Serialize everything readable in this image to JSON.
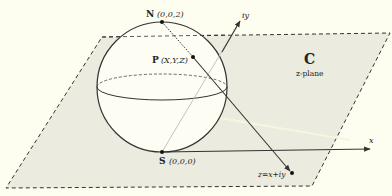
{
  "diagram": {
    "type": "stereographic-projection",
    "colors": {
      "background": "#fdfdf0",
      "plane_fill": "#ebebdf",
      "sphere_fill": "#fdfdf4",
      "stroke": "#333333"
    },
    "points": {
      "north": {
        "name": "N",
        "coords": "(0,0,2)"
      },
      "point_p": {
        "name": "P",
        "coords": "(X,Y,Z)"
      },
      "south": {
        "name": "S",
        "coords": "(0,0,0)"
      },
      "z_point": {
        "label": "z=x+iy"
      }
    },
    "plane": {
      "name": "C",
      "subtitle": "z-plane"
    },
    "axes": {
      "x_label": "x",
      "y_label": "iy"
    }
  }
}
